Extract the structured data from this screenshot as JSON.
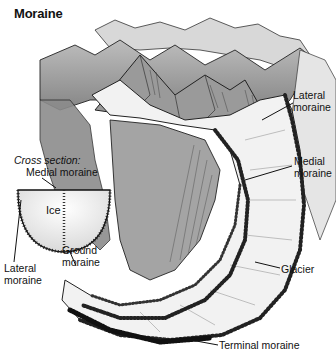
{
  "title": "Moraine",
  "cross_section": {
    "title": "Cross section:",
    "labels": {
      "medial": "Medial moraine",
      "ice": "Ice",
      "lateral_line1": "Lateral",
      "lateral_line2": "moraine",
      "ground_line1": "Ground",
      "ground_line2": "moraine"
    }
  },
  "main_labels": {
    "lateral_line1": "Lateral",
    "lateral_line2": "moraine",
    "medial_line1": "Medial",
    "medial_line2": "moraine",
    "glacier": "Glacier",
    "terminal": "Terminal moraine"
  },
  "colors": {
    "ink": "#111111",
    "rock_dark": "#555555",
    "rock_mid": "#8a8a8a",
    "rock_light": "#c8c8c8",
    "ice": "#efefef",
    "background": "#ffffff"
  }
}
